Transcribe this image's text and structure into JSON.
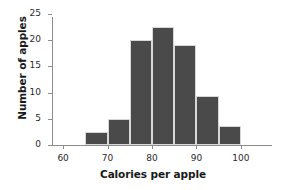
{
  "chart_data": {
    "type": "bar",
    "title": "",
    "subtitle": "",
    "xlabel": "Calories per apple",
    "ylabel": "Number of apples",
    "categories": [
      "65-70",
      "70-75",
      "75-80",
      "80-85",
      "85-90",
      "90-95",
      "95-100"
    ],
    "bin_starts": [
      65,
      70,
      75,
      80,
      85,
      90,
      95
    ],
    "bin_width": 5,
    "values": [
      2.5,
      5,
      20,
      22.5,
      19,
      9.3,
      3.6
    ],
    "xlim": [
      57.5,
      107
    ],
    "ylim": [
      0,
      25
    ],
    "xticks": [
      60,
      70,
      80,
      90,
      100
    ],
    "xtick_labels": [
      "60",
      "70",
      "80",
      "90",
      "100"
    ],
    "yticks": [
      0,
      5,
      10,
      15,
      20,
      25
    ],
    "ytick_labels": [
      "0",
      "5",
      "10",
      "15",
      "20",
      "25"
    ],
    "grid": false,
    "legend": null,
    "bar_color": "#4a4a4a",
    "axis_color": "#8d8d8d",
    "text_color": "#1a1a1a",
    "background": "#ffffff"
  }
}
